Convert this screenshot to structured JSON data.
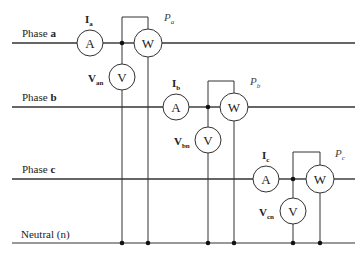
{
  "diagram": {
    "type": "three-phase wattmeter measurement circuit",
    "line_color": "#333333",
    "lines": [
      {
        "id": "a",
        "label_prefix": "Phase ",
        "label_bold": "a",
        "y": 43
      },
      {
        "id": "b",
        "label_prefix": "Phase ",
        "label_bold": "b",
        "y": 107
      },
      {
        "id": "c",
        "label_prefix": "Phase ",
        "label_bold": "c",
        "y": 179
      },
      {
        "id": "n",
        "label": "Neutral (n)",
        "y": 243
      }
    ],
    "meters": {
      "ammeter_symbol": "A",
      "voltmeter_symbol": "V",
      "wattmeter_symbol": "W"
    },
    "phases": [
      {
        "current_label": "I",
        "current_sub": "a",
        "voltage_label": "V",
        "voltage_sub": "an",
        "power_label": "P",
        "power_sub": "a"
      },
      {
        "current_label": "I",
        "current_sub": "b",
        "voltage_label": "V",
        "voltage_sub": "bn",
        "power_label": "P",
        "power_sub": "b"
      },
      {
        "current_label": "I",
        "current_sub": "c",
        "voltage_label": "V",
        "voltage_sub": "cn",
        "power_label": "P",
        "power_sub": "c"
      }
    ]
  }
}
